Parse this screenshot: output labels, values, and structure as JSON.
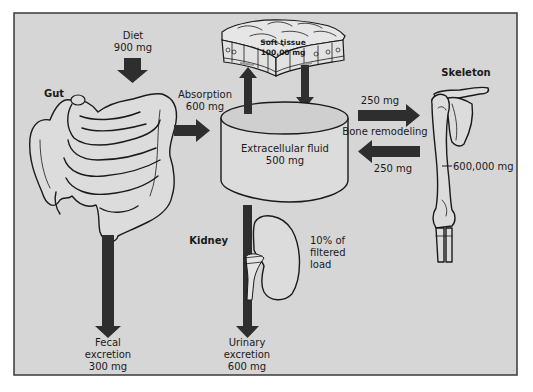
{
  "diagram": {
    "colors": {
      "page_background": "#ffffff",
      "panel_background": "#d6d6d6",
      "panel_border": "#3a3a3a",
      "arrow_fill": "#2e2e2e",
      "organ_fill": "#dcdcdc",
      "ink": "#1a1a1a"
    },
    "nodes": {
      "diet": {
        "title": "Diet",
        "amount": "900 mg"
      },
      "gut": {
        "title": "Gut"
      },
      "soft_tissue": {
        "title": "Soft tissue",
        "amount": "100,00 mg"
      },
      "extracellular_fluid": {
        "title": "Extracellular fluid",
        "amount": "500 mg"
      },
      "skeleton": {
        "title": "Skeleton",
        "amount": "600,000 mg"
      },
      "kidney": {
        "title": "Kidney",
        "note_line1": "10% of",
        "note_line2": "filtered",
        "note_line3": "load"
      }
    },
    "flows": {
      "absorption": {
        "title": "Absorption",
        "amount": "600 mg"
      },
      "bone_deposition": {
        "amount": "250 mg"
      },
      "bone_remodeling": {
        "title": "Bone remodeling"
      },
      "bone_resorption": {
        "amount": "250 mg"
      },
      "fecal_excretion": {
        "line1": "Fecal",
        "line2": "excretion",
        "amount": "300 mg"
      },
      "urinary_excretion": {
        "line1": "Urinary",
        "line2": "excretion",
        "amount": "600 mg"
      }
    }
  }
}
